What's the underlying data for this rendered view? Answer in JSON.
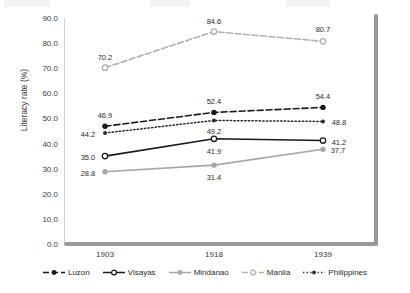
{
  "chart_data": {
    "type": "line",
    "title": "",
    "xlabel": "",
    "ylabel": "Literacy rate (%)",
    "categories": [
      "1903",
      "1918",
      "1939"
    ],
    "ylim": [
      0.0,
      90.0
    ],
    "ytick_step": 10.0,
    "yticks": [
      "90.0",
      "80.0",
      "70.0",
      "60.0",
      "50.0",
      "40.0",
      "30.0",
      "20.0",
      "10.0",
      "0.0"
    ],
    "grid": false,
    "legend_position": "bottom",
    "series": [
      {
        "name": "Luzon",
        "values": [
          46.9,
          52.4,
          54.4
        ],
        "labels": [
          "46.9",
          "52.4",
          "54.4"
        ],
        "color": "#1a1a1a",
        "line_style": "dashed",
        "marker": "filled-circle"
      },
      {
        "name": "Visayas",
        "values": [
          35.0,
          41.9,
          41.2
        ],
        "labels": [
          "35.0",
          "41.9",
          "41.2"
        ],
        "color": "#1a1a1a",
        "line_style": "solid",
        "marker": "open-circle"
      },
      {
        "name": "Mindanao",
        "values": [
          28.8,
          31.4,
          37.7
        ],
        "labels": [
          "28.8",
          "31.4",
          "37.7"
        ],
        "color": "#a6a6a6",
        "line_style": "solid",
        "marker": "filled-circle"
      },
      {
        "name": "Manila",
        "values": [
          70.2,
          84.6,
          80.7
        ],
        "labels": [
          "70.2",
          "84.6",
          "80.7"
        ],
        "color": "#b0b0b0",
        "line_style": "dash-dot",
        "marker": "open-circle"
      },
      {
        "name": "Philippines",
        "values": [
          44.2,
          49.2,
          48.8
        ],
        "labels": [
          "44.2",
          "49.2",
          "48.8"
        ],
        "color": "#2b2b2b",
        "line_style": "dotted",
        "marker": "filled-circle"
      }
    ]
  },
  "label_offsets": [
    [
      [
        0,
        -11
      ],
      [
        0,
        -11
      ],
      [
        0,
        -11
      ]
    ],
    [
      [
        -17,
        1
      ],
      [
        0,
        12
      ],
      [
        16,
        1
      ]
    ],
    [
      [
        -17,
        1
      ],
      [
        0,
        12
      ],
      [
        15,
        1
      ]
    ],
    [
      [
        0,
        -11
      ],
      [
        0,
        -11
      ],
      [
        0,
        -12
      ]
    ],
    [
      [
        -17,
        1
      ],
      [
        0,
        11
      ],
      [
        16,
        1
      ]
    ]
  ]
}
